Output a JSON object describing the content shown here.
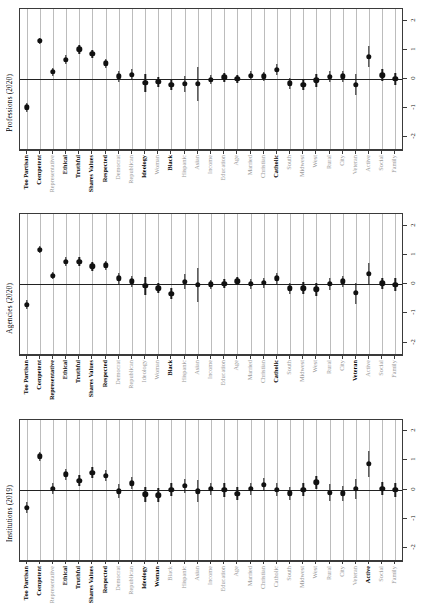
{
  "figure": {
    "type": "dot-whisker coefficient plot",
    "panel_count": 3
  },
  "axis": {
    "y_ticks": [
      "2",
      "1",
      "0",
      "-1",
      "-2"
    ],
    "y_tick_values": [
      2,
      1,
      0,
      -1,
      -2
    ],
    "ylim": [
      -2.4,
      2.4
    ]
  },
  "chart_data": {
    "type": "scatter",
    "title": "",
    "xlabel": "",
    "ylabel": "",
    "ylim": [
      -2.4,
      2.4
    ],
    "grid": "vertical gridlines at each category",
    "legend": "none",
    "categories": [
      "Too Partisan",
      "Competent",
      "Representative",
      "Ethical",
      "Truthful",
      "Shares Values",
      "Respected",
      "Democrat",
      "Republican",
      "Ideology",
      "Woman",
      "Black",
      "Hispanic",
      "Asian",
      "Income",
      "Education",
      "Age",
      "Married",
      "Christian",
      "Catholic",
      "South",
      "Midwest",
      "West",
      "Rural",
      "City",
      "Veteran",
      "Active",
      "Social",
      "Family"
    ],
    "panels": [
      {
        "name": "Professions (2020)",
        "ylabel": "Professions (2020)",
        "bold_categories": [
          "Too Partisan",
          "Competent",
          "Ethical",
          "Truthful",
          "Shares Values",
          "Respected",
          "Ideology",
          "Black",
          "Catholic"
        ],
        "values": [
          -0.97,
          1.3,
          0.24,
          0.66,
          1.02,
          0.86,
          0.54,
          0.09,
          0.15,
          -0.14,
          -0.1,
          -0.2,
          -0.17,
          -0.17,
          -0.02,
          0.06,
          0.01,
          0.12,
          0.09,
          0.31,
          -0.15,
          -0.19,
          -0.04,
          0.08,
          0.09,
          -0.19,
          0.76,
          0.13,
          0.0
        ],
        "lower": [
          -1.12,
          1.19,
          0.1,
          0.5,
          0.86,
          0.72,
          0.38,
          -0.09,
          -0.04,
          -0.45,
          -0.28,
          -0.38,
          -0.44,
          -0.76,
          -0.18,
          -0.1,
          -0.13,
          -0.03,
          -0.07,
          0.12,
          -0.34,
          -0.38,
          -0.26,
          -0.12,
          -0.1,
          -0.55,
          0.4,
          -0.07,
          -0.22
        ],
        "upper": [
          -0.82,
          1.41,
          0.38,
          0.82,
          1.18,
          1.0,
          0.7,
          0.27,
          0.34,
          0.17,
          0.08,
          -0.02,
          0.1,
          0.42,
          0.14,
          0.22,
          0.15,
          0.27,
          0.25,
          0.5,
          0.04,
          0.0,
          0.18,
          0.28,
          0.28,
          0.17,
          1.12,
          0.33,
          0.22
        ]
      },
      {
        "name": "Agencies (2020)",
        "ylabel": "Agencies (2020)",
        "bold_categories": [
          "Too Partisan",
          "Competent",
          "Representative",
          "Ethical",
          "Truthful",
          "Shares Values",
          "Respected",
          "Black",
          "Catholic",
          "Veteran"
        ],
        "values": [
          -0.7,
          1.18,
          0.3,
          0.78,
          0.78,
          0.62,
          0.65,
          0.21,
          0.1,
          -0.06,
          -0.13,
          -0.33,
          0.09,
          -0.02,
          0.0,
          0.02,
          0.1,
          0.01,
          0.05,
          0.2,
          -0.14,
          -0.13,
          -0.17,
          0.02,
          0.11,
          -0.3,
          0.36,
          0.03,
          -0.02
        ],
        "lower": [
          -0.85,
          1.06,
          0.17,
          0.64,
          0.63,
          0.47,
          0.49,
          0.02,
          -0.09,
          -0.38,
          -0.31,
          -0.52,
          -0.16,
          -0.6,
          -0.16,
          -0.14,
          -0.04,
          -0.15,
          -0.11,
          0.02,
          -0.33,
          -0.33,
          -0.39,
          -0.18,
          -0.08,
          -0.66,
          0.0,
          -0.17,
          -0.24
        ],
        "upper": [
          -0.55,
          1.3,
          0.43,
          0.92,
          0.93,
          0.77,
          0.81,
          0.4,
          0.29,
          0.26,
          0.05,
          -0.14,
          0.34,
          0.56,
          0.16,
          0.18,
          0.24,
          0.17,
          0.21,
          0.38,
          0.05,
          0.07,
          0.05,
          0.22,
          0.3,
          0.06,
          0.72,
          0.23,
          0.2
        ]
      },
      {
        "name": "Institutions (2019)",
        "ylabel": "Institutions (2019)",
        "bold_categories": [
          "Too Partisan",
          "Competent",
          "Ethical",
          "Truthful",
          "Shares Values",
          "Respected",
          "Ideology",
          "Woman",
          "Active"
        ],
        "values": [
          -0.62,
          1.14,
          0.03,
          0.52,
          0.3,
          0.58,
          0.48,
          -0.05,
          0.22,
          -0.16,
          -0.2,
          0.0,
          0.14,
          -0.05,
          0.02,
          -0.01,
          -0.14,
          0.02,
          0.17,
          0.0,
          -0.12,
          0.0,
          0.25,
          -0.1,
          -0.13,
          0.02,
          0.88,
          0.03,
          -0.01
        ],
        "lower": [
          -0.8,
          0.99,
          -0.16,
          0.34,
          0.11,
          0.4,
          0.28,
          -0.3,
          0.01,
          -0.42,
          -0.44,
          -0.23,
          -0.1,
          -0.42,
          -0.2,
          -0.24,
          -0.36,
          -0.2,
          -0.06,
          -0.22,
          -0.34,
          -0.23,
          0.02,
          -0.4,
          -0.38,
          -0.32,
          0.42,
          -0.2,
          -0.25
        ],
        "upper": [
          -0.44,
          1.29,
          0.22,
          0.7,
          0.49,
          0.76,
          0.68,
          0.2,
          0.43,
          0.1,
          0.04,
          0.23,
          0.38,
          0.32,
          0.24,
          0.22,
          0.08,
          0.24,
          0.4,
          0.22,
          0.1,
          0.23,
          0.48,
          0.2,
          0.12,
          0.36,
          1.34,
          0.26,
          0.23
        ]
      }
    ]
  }
}
